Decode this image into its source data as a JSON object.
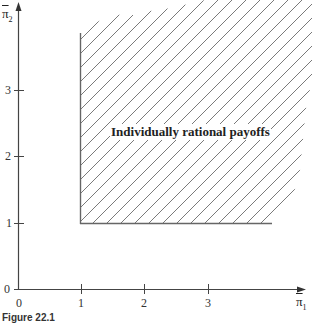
{
  "diagram": {
    "region_label": "Individually rational payoffs",
    "x_axis": {
      "symbol": "π",
      "subscript": "1",
      "ticks": [
        "0",
        "1",
        "2",
        "3"
      ]
    },
    "y_axis": {
      "symbol": "π",
      "subscript": "2",
      "ticks": [
        "0",
        "1",
        "2",
        "3"
      ]
    },
    "caption": "Figure 22.1",
    "colors": {
      "axis": "#444444",
      "hatch": "#777777",
      "boundary": "#666666"
    }
  }
}
